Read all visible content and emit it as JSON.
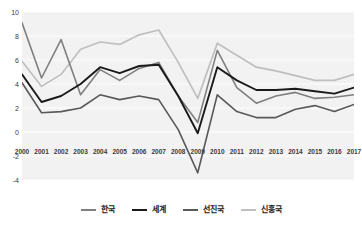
{
  "chart_data": {
    "type": "line",
    "title": "",
    "xlabel": "",
    "ylabel": "",
    "categories": [
      "2000",
      "2001",
      "2002",
      "2003",
      "2004",
      "2005",
      "2006",
      "2007",
      "2008",
      "2009",
      "2010",
      "2011",
      "2012",
      "2013",
      "2014",
      "2015",
      "2016",
      "2017"
    ],
    "ylim": [
      -4,
      10
    ],
    "ytick_values": [
      10,
      8,
      6,
      4,
      2,
      0,
      -2,
      -4
    ],
    "ytick_labels": [
      "10",
      "8",
      "6",
      "4",
      "2",
      "0",
      "-2",
      "-4"
    ],
    "grid": true,
    "legend_position": "bottom",
    "series": [
      {
        "name": "한국",
        "color": "#7f7f7f",
        "width": 1.6,
        "values": [
          9.1,
          4.5,
          7.7,
          3.1,
          5.2,
          4.3,
          5.3,
          5.8,
          3.0,
          0.8,
          6.8,
          3.7,
          2.4,
          3.0,
          3.3,
          2.8,
          2.9,
          3.1
        ]
      },
      {
        "name": "세계",
        "color": "#1a1a1a",
        "width": 1.9,
        "values": [
          4.8,
          2.5,
          3.0,
          4.0,
          5.4,
          4.9,
          5.5,
          5.6,
          3.0,
          -0.1,
          5.4,
          4.3,
          3.5,
          3.5,
          3.6,
          3.4,
          3.2,
          3.7
        ]
      },
      {
        "name": "선진국",
        "color": "#595959",
        "width": 1.6,
        "values": [
          4.1,
          1.6,
          1.7,
          2.0,
          3.1,
          2.7,
          3.0,
          2.7,
          0.2,
          -3.4,
          3.1,
          1.7,
          1.2,
          1.2,
          1.9,
          2.2,
          1.7,
          2.3
        ]
      },
      {
        "name": "신흥국",
        "color": "#bfbfbf",
        "width": 1.7,
        "values": [
          5.9,
          3.8,
          4.8,
          6.9,
          7.5,
          7.3,
          8.1,
          8.5,
          5.8,
          2.8,
          7.4,
          6.4,
          5.4,
          5.1,
          4.7,
          4.3,
          4.3,
          4.8
        ]
      }
    ]
  },
  "legend": {
    "items": [
      {
        "label": "한국",
        "color": "#7f7f7f"
      },
      {
        "label": "세계",
        "color": "#1a1a1a"
      },
      {
        "label": "선진국",
        "color": "#595959"
      },
      {
        "label": "신흥국",
        "color": "#bfbfbf"
      }
    ]
  }
}
